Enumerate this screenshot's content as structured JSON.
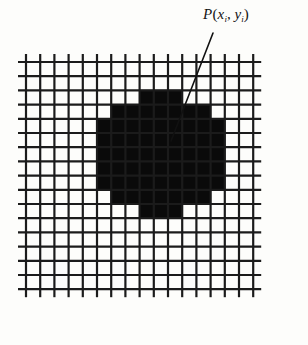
{
  "figure": {
    "type": "raster-grid-diagram",
    "background_color": "#fdfdfb",
    "annotation": {
      "name": "point-label",
      "text": "P(xi, yi)",
      "symbol": "P",
      "open_paren": "(",
      "var_x": "x",
      "sub_x": "i",
      "comma": ", ",
      "var_y": "y",
      "sub_y": "i",
      "close_paren": ")",
      "color": "#141414",
      "leader_line": {
        "name": "leader-line",
        "from_x": 213,
        "from_y": 33,
        "to_x": 171,
        "to_y": 141,
        "color": "#111111",
        "width": 1.6
      }
    },
    "grid": {
      "name": "pixel-grid",
      "origin_x": 26,
      "origin_y": 62,
      "cell_size": 14.2,
      "columns": 16,
      "rows": 16,
      "line_color": "#1b1b1b",
      "line_width": 2.2,
      "cell_fill": "#ffffff",
      "overhang": 8
    },
    "blob": {
      "name": "digitized-region",
      "fill": "#0a0a0a",
      "description": "Filled pixel cells forming a digitized disc",
      "cells": [
        [
          5,
          4
        ],
        [
          5,
          5
        ],
        [
          5,
          6
        ],
        [
          5,
          7
        ],
        [
          5,
          8
        ],
        [
          6,
          3
        ],
        [
          6,
          4
        ],
        [
          6,
          5
        ],
        [
          6,
          6
        ],
        [
          6,
          7
        ],
        [
          6,
          8
        ],
        [
          6,
          9
        ],
        [
          7,
          3
        ],
        [
          7,
          4
        ],
        [
          7,
          5
        ],
        [
          7,
          6
        ],
        [
          7,
          7
        ],
        [
          7,
          8
        ],
        [
          7,
          9
        ],
        [
          8,
          2
        ],
        [
          8,
          3
        ],
        [
          8,
          4
        ],
        [
          8,
          5
        ],
        [
          8,
          6
        ],
        [
          8,
          7
        ],
        [
          8,
          8
        ],
        [
          8,
          9
        ],
        [
          8,
          10
        ],
        [
          9,
          2
        ],
        [
          9,
          3
        ],
        [
          9,
          4
        ],
        [
          9,
          5
        ],
        [
          9,
          6
        ],
        [
          9,
          7
        ],
        [
          9,
          8
        ],
        [
          9,
          9
        ],
        [
          9,
          10
        ],
        [
          10,
          2
        ],
        [
          10,
          3
        ],
        [
          10,
          4
        ],
        [
          10,
          5
        ],
        [
          10,
          6
        ],
        [
          10,
          7
        ],
        [
          10,
          8
        ],
        [
          10,
          9
        ],
        [
          10,
          10
        ],
        [
          11,
          3
        ],
        [
          11,
          4
        ],
        [
          11,
          5
        ],
        [
          11,
          6
        ],
        [
          11,
          7
        ],
        [
          11,
          8
        ],
        [
          11,
          9
        ],
        [
          12,
          3
        ],
        [
          12,
          4
        ],
        [
          12,
          5
        ],
        [
          12,
          6
        ],
        [
          12,
          7
        ],
        [
          12,
          8
        ],
        [
          12,
          9
        ],
        [
          13,
          4
        ],
        [
          13,
          5
        ],
        [
          13,
          6
        ],
        [
          13,
          7
        ],
        [
          13,
          8
        ]
      ]
    }
  }
}
